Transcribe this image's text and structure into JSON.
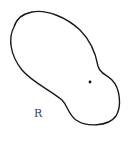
{
  "diagram": {
    "type": "region-with-point",
    "region": {
      "label": "R",
      "stroke_color": "#1a1a1a",
      "fill_color": "#ffffff",
      "path": "M 14 27 C 8 38, 10 55, 22 70 C 32 82, 50 90, 62 100 C 68 106, 68 114, 76 120 C 86 127, 108 127, 116 116 C 122 106, 120 88, 112 80 C 106 74, 100 74, 98 66 C 96 55, 92 42, 80 30 C 66 17, 46 9, 32 12 C 22 14, 16 20, 14 27 Z"
    },
    "point": {
      "x": 90,
      "y": 82,
      "color": "#111111"
    },
    "label_position": {
      "x": 34,
      "y": 108
    }
  }
}
